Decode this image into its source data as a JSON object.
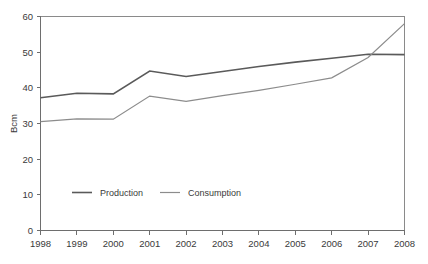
{
  "chart_data": {
    "type": "line",
    "title": "",
    "xlabel": "",
    "ylabel": "Bcm",
    "x": [
      1998,
      1999,
      2000,
      2001,
      2002,
      2003,
      2004,
      2005,
      2006,
      2007,
      2008
    ],
    "categories": [
      "1998",
      "1999",
      "2000",
      "2001",
      "2002",
      "2003",
      "2004",
      "2005",
      "2006",
      "2007",
      "2008"
    ],
    "series": [
      {
        "name": "Production",
        "color": "#5a5a5a",
        "values": [
          37.2,
          38.5,
          38.3,
          44.7,
          43.2,
          44.6,
          46.0,
          47.2,
          48.3,
          49.4,
          49.3
        ]
      },
      {
        "name": "Consumption",
        "color": "#8c8c8c",
        "values": [
          30.5,
          31.3,
          31.2,
          37.7,
          36.2,
          37.8,
          39.3,
          41.0,
          42.8,
          48.5,
          58.0
        ]
      }
    ],
    "ylim": [
      0,
      60
    ],
    "xlim": [
      1998,
      2008
    ],
    "y_ticks": [
      0,
      10,
      20,
      30,
      40,
      50,
      60
    ],
    "y_tick_labels": [
      "0",
      "10",
      "20",
      "30",
      "40",
      "50",
      "60"
    ],
    "x_tick_labels": [
      "1998",
      "1999",
      "2000",
      "2001",
      "2002",
      "2003",
      "2004",
      "2005",
      "2006",
      "2007",
      "2008"
    ],
    "grid": false,
    "legend_position": "inside-lower-left"
  },
  "legend": {
    "items": [
      {
        "label": "Production",
        "color": "#5a5a5a"
      },
      {
        "label": "Consumption",
        "color": "#8c8c8c"
      }
    ]
  },
  "axes": {
    "y_axis_title": "Bcm"
  }
}
